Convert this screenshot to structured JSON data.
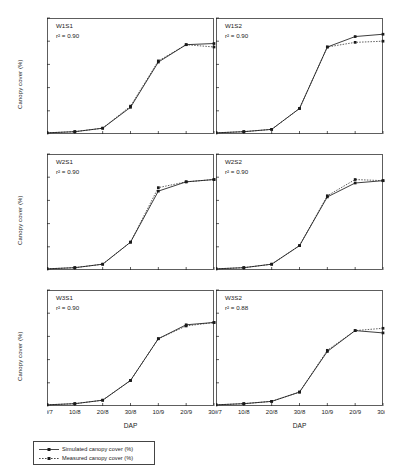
{
  "chart_data": {
    "type": "line",
    "title": "",
    "xlabel": "DAP",
    "ylabel": "Canopy cover (%)",
    "xtick_labels": [
      "30/7",
      "10/8",
      "20/8",
      "30/8",
      "10/9",
      "20/9",
      "30/9"
    ],
    "ytick_labels": [
      "20",
      "40",
      "60",
      "80",
      "100"
    ],
    "ylim": [
      0,
      100
    ],
    "yticks": [
      20,
      40,
      60,
      80,
      100
    ],
    "grid": false,
    "legend_position": "bottom-left",
    "legend": [
      {
        "name": "Simulated canopy cover (%)",
        "marker": "square",
        "line": "solid"
      },
      {
        "name": "Measured canopy cover (%)",
        "marker": "square",
        "line": "dotted"
      }
    ],
    "panels": [
      {
        "label": "W1S1",
        "r2_label": "r² = 0.90",
        "r2_value": 0.9,
        "x": [
          "30/7",
          "10/8",
          "20/8",
          "30/8",
          "10/9",
          "20/9",
          "30/9"
        ],
        "series": [
          {
            "name": "Simulated canopy cover (%)",
            "values": [
              1,
              2,
              5,
              23,
              62,
              77,
              78
            ]
          },
          {
            "name": "Measured canopy cover (%)",
            "values": [
              1,
              2,
              5,
              24,
              63,
              77,
              75
            ]
          }
        ]
      },
      {
        "label": "W1S2",
        "r2_label": "r² = 0.90",
        "r2_value": 0.9,
        "x": [
          "30/7",
          "10/8",
          "20/8",
          "30/8",
          "10/9",
          "20/9",
          "30/9"
        ],
        "series": [
          {
            "name": "Simulated canopy cover (%)",
            "values": [
              1,
              2,
              4,
              22,
              75,
              84,
              86
            ]
          },
          {
            "name": "Measured canopy cover (%)",
            "values": [
              1,
              2,
              4,
              22,
              75,
              79,
              80
            ]
          }
        ]
      },
      {
        "label": "W2S1",
        "r2_label": "r² = 0.90",
        "r2_value": 0.9,
        "x": [
          "30/7",
          "10/8",
          "20/8",
          "30/8",
          "10/9",
          "20/9",
          "30/9"
        ],
        "series": [
          {
            "name": "Simulated canopy cover (%)",
            "values": [
              1,
              2,
              5,
              24,
              68,
              76,
              78
            ]
          },
          {
            "name": "Measured canopy cover (%)",
            "values": [
              1,
              2,
              5,
              24,
              71,
              76,
              78
            ]
          }
        ]
      },
      {
        "label": "W2S2",
        "r2_label": "r² = 0.90",
        "r2_value": 0.9,
        "x": [
          "30/7",
          "10/8",
          "20/8",
          "30/8",
          "10/9",
          "20/9",
          "30/9"
        ],
        "series": [
          {
            "name": "Simulated canopy cover (%)",
            "values": [
              1,
              2,
              5,
              21,
              63,
              75,
              77
            ]
          },
          {
            "name": "Measured canopy cover (%)",
            "values": [
              1,
              2,
              5,
              21,
              64,
              78,
              77
            ]
          }
        ]
      },
      {
        "label": "W3S1",
        "r2_label": "r² = 0.90",
        "r2_value": 0.9,
        "x": [
          "30/7",
          "10/8",
          "20/8",
          "30/8",
          "10/9",
          "20/9",
          "30/9"
        ],
        "series": [
          {
            "name": "Simulated canopy cover (%)",
            "values": [
              1,
              2,
              5,
              22,
              58,
              70,
              72
            ]
          },
          {
            "name": "Measured canopy cover (%)",
            "values": [
              1,
              2,
              5,
              22,
              58,
              69,
              72
            ]
          }
        ]
      },
      {
        "label": "W3S2",
        "r2_label": "r² = 0.88",
        "r2_value": 0.88,
        "x": [
          "30/7",
          "10/8",
          "20/8",
          "30/8",
          "10/9",
          "20/9",
          "30/9"
        ],
        "series": [
          {
            "name": "Simulated canopy cover (%)",
            "values": [
              1,
              2,
              4,
              12,
              47,
              65,
              63
            ]
          },
          {
            "name": "Measured canopy cover (%)",
            "values": [
              1,
              2,
              4,
              12,
              48,
              65,
              67
            ]
          }
        ]
      }
    ]
  }
}
